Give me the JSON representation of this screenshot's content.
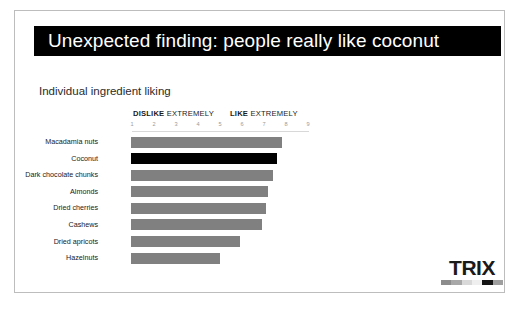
{
  "slide": {
    "title": "Unexpected finding: people really like coconut",
    "subtitle": "Individual ingredient liking",
    "title_bg": "#000000",
    "title_color": "#ffffff"
  },
  "scale": {
    "left_anchor_bold": "DISLIKE",
    "left_anchor_rest": "EXTREMELY",
    "right_anchor_bold": "LIKE",
    "right_anchor_rest": "EXTREMELY",
    "ticks": [
      "1",
      "2",
      "3",
      "4",
      "5",
      "6",
      "7",
      "8",
      "9"
    ]
  },
  "logo": {
    "wordmark": "TRIX",
    "swatches": [
      "#8c8c8c",
      "#a8a8a8",
      "#d9d9d9",
      "#efefef",
      "#141414",
      "#9e9e9e"
    ]
  },
  "bottom_fragment": {
    "text": ""
  },
  "chart_data": {
    "type": "bar",
    "orientation": "horizontal",
    "title": "Individual ingredient liking",
    "xlabel": "",
    "ylabel": "",
    "xlim": [
      1,
      9
    ],
    "grid": false,
    "legend": false,
    "bar_color": "#808080",
    "highlight_color": "#000000",
    "highlight_category": "Coconut",
    "axis_anchors": {
      "low": "DISLIKE EXTREMELY",
      "high": "LIKE EXTREMELY"
    },
    "tick_labels": [
      "1",
      "2",
      "3",
      "4",
      "5",
      "6",
      "7",
      "8",
      "9"
    ],
    "categories": [
      "Macadamia nuts",
      "Coconut",
      "Dark chocolate chunks",
      "Almonds",
      "Dried cherries",
      "Cashews",
      "Dried apricots",
      "Hazelnuts"
    ],
    "values": [
      7.8,
      7.6,
      7.4,
      7.2,
      7.1,
      6.9,
      5.9,
      5.0
    ]
  }
}
